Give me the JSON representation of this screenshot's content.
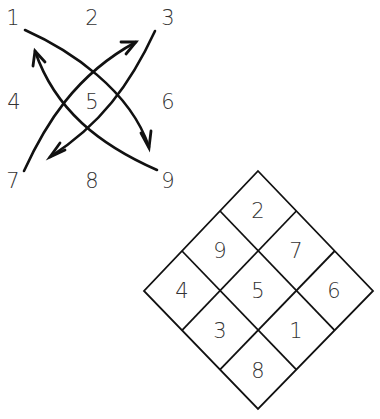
{
  "figure_left": {
    "title": "Lo Shu sequence paths",
    "labels": [
      {
        "text": "1",
        "x": 13,
        "y": 18
      },
      {
        "text": "2",
        "x": 92,
        "y": 18
      },
      {
        "text": "3",
        "x": 168,
        "y": 18
      },
      {
        "text": "4",
        "x": 14,
        "y": 102
      },
      {
        "text": "5",
        "x": 92,
        "y": 102
      },
      {
        "text": "6",
        "x": 168,
        "y": 102
      },
      {
        "text": "7",
        "x": 13,
        "y": 181
      },
      {
        "text": "8",
        "x": 92,
        "y": 181
      },
      {
        "text": "9",
        "x": 168,
        "y": 181
      }
    ],
    "arrows": [
      {
        "name": "arrow-1-to-9",
        "path": "M25,30 C70,50 130,90 149,147",
        "head": "M141,133 L149,148 L151,131"
      },
      {
        "name": "arrow-3-to-7",
        "path": "M155,31 C130,85 100,125 50,157",
        "head": "M65,150 L50,157 L60,143"
      },
      {
        "name": "arrow-9-to-1",
        "path": "M157,170 C100,145 55,110 35,51",
        "head": "M33,66 L35,51 L45,62"
      },
      {
        "name": "arrow-7-to-3",
        "path": "M24,171 C45,125 75,75 136,42",
        "head": "M121,42 L136,42 L126,54"
      }
    ]
  },
  "figure_right": {
    "title": "Rotated magic square",
    "diamond": {
      "top": [
        258,
        171
      ],
      "right": [
        373,
        291
      ],
      "bottom": [
        258,
        409
      ],
      "left": [
        144,
        291
      ]
    },
    "cells": [
      {
        "text": "2",
        "x": 258,
        "y": 211
      },
      {
        "text": "9",
        "x": 220,
        "y": 251
      },
      {
        "text": "7",
        "x": 296,
        "y": 251
      },
      {
        "text": "4",
        "x": 182,
        "y": 291
      },
      {
        "text": "5",
        "x": 258,
        "y": 291
      },
      {
        "text": "6",
        "x": 334,
        "y": 291
      },
      {
        "text": "3",
        "x": 220,
        "y": 331
      },
      {
        "text": "1",
        "x": 296,
        "y": 331
      },
      {
        "text": "8",
        "x": 258,
        "y": 371
      }
    ]
  },
  "colors": {
    "line": "#111111",
    "text": "#333333",
    "background": "#ffffff"
  }
}
